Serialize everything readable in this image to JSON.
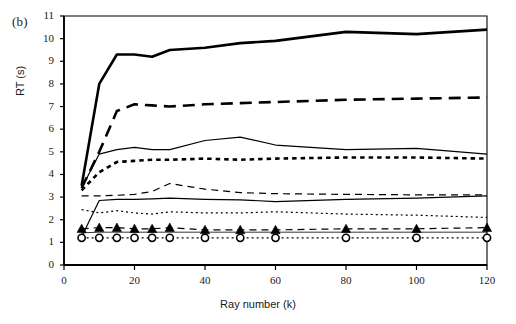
{
  "figure": {
    "panel_label": "(b)",
    "background": "#ffffff",
    "line_color": "#000000",
    "width": 516,
    "height": 324
  },
  "chart_data": {
    "type": "line",
    "title": "",
    "panel": "(b)",
    "xlabel": "Ray number (k)",
    "ylabel": "RT (s)",
    "xlim": [
      0,
      120
    ],
    "ylim": [
      0,
      11
    ],
    "xticks": [
      0,
      20,
      40,
      60,
      80,
      100,
      120
    ],
    "yticks": [
      0,
      1,
      2,
      3,
      4,
      5,
      6,
      7,
      8,
      9,
      10,
      11
    ],
    "xtick_labels": [
      "0",
      "20",
      "40",
      "60",
      "80",
      "100",
      "120"
    ],
    "ytick_labels": [
      "0",
      "1",
      "2",
      "3",
      "4",
      "5",
      "6",
      "7",
      "8",
      "9",
      "10",
      "11"
    ],
    "grid": false,
    "legend": "none",
    "x": [
      5,
      10,
      15,
      20,
      25,
      30,
      40,
      50,
      60,
      80,
      100,
      120
    ],
    "series": [
      {
        "name": "series-1-thick-solid",
        "style": "solid",
        "width": "thick",
        "marker": "none",
        "values": [
          3.5,
          8.0,
          9.3,
          9.3,
          9.2,
          9.5,
          9.6,
          9.8,
          9.9,
          10.3,
          10.2,
          10.4
        ]
      },
      {
        "name": "series-2-thick-dashed",
        "style": "dashed",
        "width": "thick",
        "marker": "none",
        "values": [
          3.4,
          5.0,
          6.8,
          7.1,
          7.05,
          7.0,
          7.1,
          7.15,
          7.2,
          7.3,
          7.35,
          7.4
        ]
      },
      {
        "name": "series-3-thin-solid",
        "style": "solid",
        "width": "thin",
        "marker": "none",
        "values": [
          3.4,
          4.9,
          5.1,
          5.2,
          5.1,
          5.1,
          5.5,
          5.65,
          5.3,
          5.1,
          5.15,
          4.9
        ]
      },
      {
        "name": "series-4-thick-dotted",
        "style": "dotted",
        "width": "thick",
        "marker": "none",
        "values": [
          3.3,
          4.1,
          4.55,
          4.6,
          4.65,
          4.65,
          4.7,
          4.65,
          4.7,
          4.75,
          4.75,
          4.7
        ]
      },
      {
        "name": "series-5-thin-dashed",
        "style": "dashed",
        "width": "thin",
        "marker": "none",
        "values": [
          3.05,
          3.05,
          3.08,
          3.12,
          3.25,
          3.6,
          3.35,
          3.2,
          3.15,
          3.12,
          3.1,
          3.1
        ]
      },
      {
        "name": "series-6-thin-solid-low",
        "style": "solid",
        "width": "thin",
        "marker": "none",
        "values": [
          1.25,
          2.85,
          2.9,
          2.9,
          2.92,
          2.95,
          2.9,
          2.88,
          2.8,
          2.9,
          2.95,
          3.05
        ]
      },
      {
        "name": "series-7-thin-dotted",
        "style": "dotted",
        "width": "thin",
        "marker": "none",
        "values": [
          2.45,
          2.3,
          2.4,
          2.3,
          2.25,
          2.35,
          2.3,
          2.3,
          2.35,
          2.25,
          2.2,
          2.1
        ]
      },
      {
        "name": "series-8-dashed-triangle",
        "style": "dashed",
        "width": "thin",
        "marker": "triangle-filled",
        "values": [
          1.6,
          1.65,
          1.65,
          1.6,
          1.6,
          1.65,
          1.55,
          1.55,
          1.55,
          1.6,
          1.6,
          1.65
        ]
      },
      {
        "name": "series-9-solid-thin-flat",
        "style": "solid",
        "width": "hairline",
        "marker": "none",
        "values": [
          1.42,
          1.45,
          1.45,
          1.45,
          1.45,
          1.45,
          1.45,
          1.45,
          1.45,
          1.45,
          1.45,
          1.45
        ]
      },
      {
        "name": "series-10-dotted-circle",
        "style": "dotted",
        "width": "thin",
        "marker": "circle-open",
        "values": [
          1.2,
          1.2,
          1.2,
          1.2,
          1.2,
          1.2,
          1.2,
          1.2,
          1.2,
          1.2,
          1.2,
          1.2
        ]
      }
    ]
  }
}
